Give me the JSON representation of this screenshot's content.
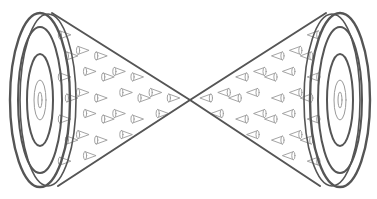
{
  "illustration": {
    "description": "Two cones joined at their apexes, each with concentric rings on the base and small cone shapes scattered inside",
    "colors": {
      "line": "#555555",
      "fine_line": "#9a9a9a",
      "background": "#ffffff"
    },
    "left_cone": {
      "base_center": [
        40,
        100
      ],
      "rings": [
        [
          30,
          87
        ],
        [
          22,
          73
        ],
        [
          13,
          46
        ],
        [
          6,
          20
        ],
        [
          2,
          8
        ]
      ],
      "apex": [
        190,
        100
      ],
      "edge_top_start": [
        52,
        13
      ],
      "edge_bottom_start": [
        58,
        186
      ]
    },
    "right_cone": {
      "base_center": [
        340,
        100
      ],
      "rings": [
        [
          30,
          87
        ],
        [
          22,
          73
        ],
        [
          13,
          46
        ],
        [
          6,
          20
        ],
        [
          2,
          8
        ]
      ],
      "apex": [
        190,
        100
      ],
      "edge_top_start": [
        326,
        13
      ],
      "edge_bottom_start": [
        320,
        186
      ]
    },
    "small_cone_count_per_side": 34
  }
}
